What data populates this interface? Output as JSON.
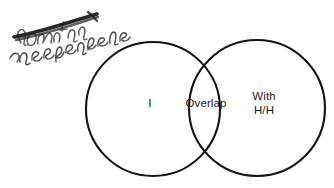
{
  "diagram": {
    "type": "venn-two-set",
    "background_color": "#ffffff",
    "stroke_color": "#121212",
    "text_color": "#1a1a1a",
    "left_circle": {
      "name": "left-set-circle",
      "center_x": 153,
      "center_y": 109,
      "radius": 67,
      "label": "I"
    },
    "right_circle": {
      "name": "right-set-circle",
      "center_x": 257,
      "center_y": 108,
      "radius": 68,
      "label": "With\nH/H"
    },
    "intersection": {
      "name": "overlap-region",
      "label": "Overlap"
    }
  },
  "annotation": {
    "name": "handwritten-note",
    "ink_color": "#3a3a3a",
    "strikethrough_color": "#1c1c1c",
    "struck_word": "dominate",
    "replacement_word": "inseparable"
  }
}
